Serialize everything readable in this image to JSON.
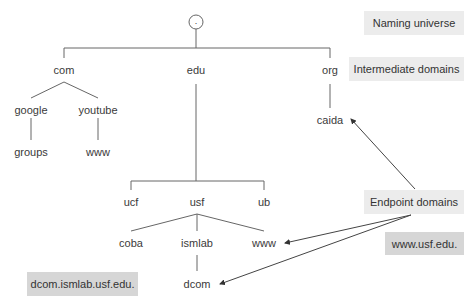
{
  "diagram": {
    "root": {
      "label": ".",
      "x": 196,
      "y": 22
    },
    "nodes": {
      "com": {
        "label": "com",
        "x": 64,
        "y": 70
      },
      "edu": {
        "label": "edu",
        "x": 196,
        "y": 70
      },
      "org": {
        "label": "org",
        "x": 330,
        "y": 70
      },
      "google": {
        "label": "google",
        "x": 31,
        "y": 110
      },
      "youtube": {
        "label": "youtube",
        "x": 98,
        "y": 110
      },
      "groups": {
        "label": "groups",
        "x": 31,
        "y": 152
      },
      "www_youtube": {
        "label": "www",
        "x": 98,
        "y": 152
      },
      "caida": {
        "label": "caida",
        "x": 330,
        "y": 120
      },
      "ucf": {
        "label": "ucf",
        "x": 131,
        "y": 202
      },
      "usf": {
        "label": "usf",
        "x": 197,
        "y": 202
      },
      "ub": {
        "label": "ub",
        "x": 264,
        "y": 202
      },
      "coba": {
        "label": "coba",
        "x": 131,
        "y": 243
      },
      "ismlab": {
        "label": "ismlab",
        "x": 197,
        "y": 243
      },
      "www_usf": {
        "label": "www",
        "x": 264,
        "y": 243
      },
      "dcom": {
        "label": "dcom",
        "x": 197,
        "y": 284
      }
    },
    "legend": {
      "naming_universe": "Naming universe",
      "intermediate_domains": "Intermediate domains",
      "endpoint_domains": "Endpoint domains"
    },
    "examples": {
      "www_usf_edu": "www.usf.edu.",
      "dcom_ismlab_usf_edu": "dcom.ismlab.usf.edu."
    },
    "colors": {
      "line": "#555555",
      "box_light": "#ececec",
      "box_dark": "#d6d6d6"
    }
  }
}
